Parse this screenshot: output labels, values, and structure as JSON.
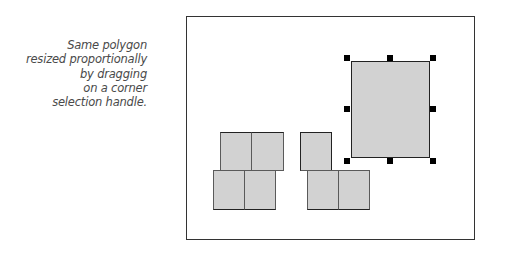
{
  "caption": {
    "lines": [
      "Same polygon",
      "resized proportionally",
      "by dragging",
      "on a corner",
      "selection handle."
    ],
    "color": "#4a4a4a"
  },
  "canvas": {
    "border_color": "#333333",
    "shape_fill": "#d2d2d2",
    "groups": [
      {
        "name": "left-polygon",
        "cells": [
          {
            "x": 34,
            "y": 116,
            "w": 32,
            "h": 39
          },
          {
            "x": 65,
            "y": 116,
            "w": 32,
            "h": 39
          },
          {
            "x": 27,
            "y": 154,
            "w": 32,
            "h": 39
          },
          {
            "x": 58,
            "y": 154,
            "w": 32,
            "h": 39
          }
        ]
      },
      {
        "name": "middle-polygon",
        "cells": [
          {
            "x": 114,
            "y": 116,
            "w": 32,
            "h": 39
          },
          {
            "x": 121,
            "y": 154,
            "w": 32,
            "h": 39
          },
          {
            "x": 152,
            "y": 154,
            "w": 32,
            "h": 39
          }
        ]
      }
    ],
    "selected_polygon": {
      "x": 165,
      "y": 45,
      "w": 78,
      "h": 97
    },
    "selection_handles": [
      "top-left",
      "top-center",
      "top-right",
      "middle-left",
      "middle-right",
      "bottom-left",
      "bottom-center",
      "bottom-right"
    ]
  }
}
